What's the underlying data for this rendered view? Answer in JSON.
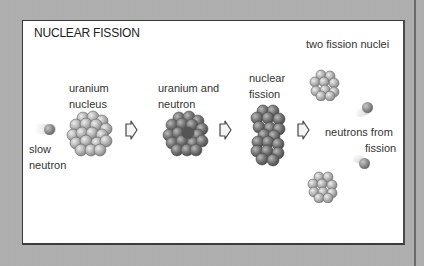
{
  "diagram": {
    "title": "NUCLEAR FISSION",
    "labels": {
      "slow_neutron_1": "slow",
      "slow_neutron_2": "neutron",
      "uranium_nucleus_1": "uranium",
      "uranium_nucleus_2": "nucleus",
      "uranium_and_neutron_1": "uranium and",
      "uranium_and_neutron_2": "neutron",
      "nuclear_fission_1": "nuclear",
      "nuclear_fission_2": "fission",
      "two_fission_nuclei": "two fission nuclei",
      "neutrons_from_fission_1": "neutrons from",
      "neutrons_from_fission_2": "fission"
    },
    "stages": [
      "slow neutron",
      "uranium nucleus",
      "uranium and neutron",
      "nuclear fission",
      "two fission nuclei",
      "neutrons from fission"
    ],
    "colors": {
      "background": "#b0b0b0",
      "panel": "#ffffff",
      "light_nucleon": "#bdbdbd",
      "dark_nucleon": "#7a7a7a",
      "neutron": "#7d7d7d"
    }
  }
}
